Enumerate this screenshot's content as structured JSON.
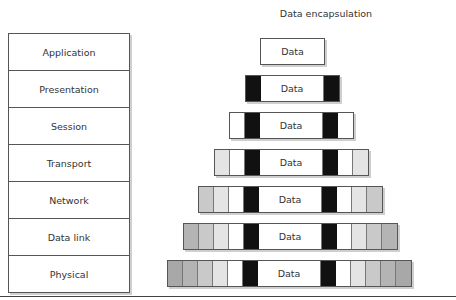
{
  "diagram": {
    "title": "Data encapsulation",
    "layers": [
      {
        "label": "Application"
      },
      {
        "label": "Presentation"
      },
      {
        "label": "Session"
      },
      {
        "label": "Transport"
      },
      {
        "label": "Network"
      },
      {
        "label": "Data link"
      },
      {
        "label": "Physical"
      }
    ],
    "pdus": [
      {
        "layer": "Application",
        "data_label": "Data",
        "header_cells": [],
        "trailer_cells": []
      },
      {
        "layer": "Presentation",
        "data_label": "Data",
        "header_cells": [
          "black"
        ],
        "trailer_cells": [
          "black"
        ]
      },
      {
        "layer": "Session",
        "data_label": "Data",
        "header_cells": [
          "white",
          "black"
        ],
        "trailer_cells": [
          "black",
          "white"
        ]
      },
      {
        "layer": "Transport",
        "data_label": "Data",
        "header_cells": [
          "light",
          "white",
          "black"
        ],
        "trailer_cells": [
          "black",
          "white",
          "light"
        ]
      },
      {
        "layer": "Network",
        "data_label": "Data",
        "header_cells": [
          "mid",
          "light",
          "white",
          "black"
        ],
        "trailer_cells": [
          "black",
          "white",
          "light",
          "mid"
        ]
      },
      {
        "layer": "Data link",
        "data_label": "Data",
        "header_cells": [
          "dark",
          "mid",
          "light",
          "white",
          "black"
        ],
        "trailer_cells": [
          "black",
          "white",
          "light",
          "mid",
          "dark"
        ]
      },
      {
        "layer": "Physical",
        "data_label": "Data",
        "header_cells": [
          "darker",
          "dark",
          "mid",
          "light",
          "white",
          "black"
        ],
        "trailer_cells": [
          "black",
          "white",
          "light",
          "mid",
          "dark",
          "darker"
        ]
      }
    ],
    "colors": {
      "black": "#111111",
      "white": "#ffffff",
      "light": "#e4e4e4",
      "mid": "#c9c9c9",
      "dark": "#b4b4b4",
      "darker": "#a8a8a8",
      "border": "#555555"
    }
  }
}
